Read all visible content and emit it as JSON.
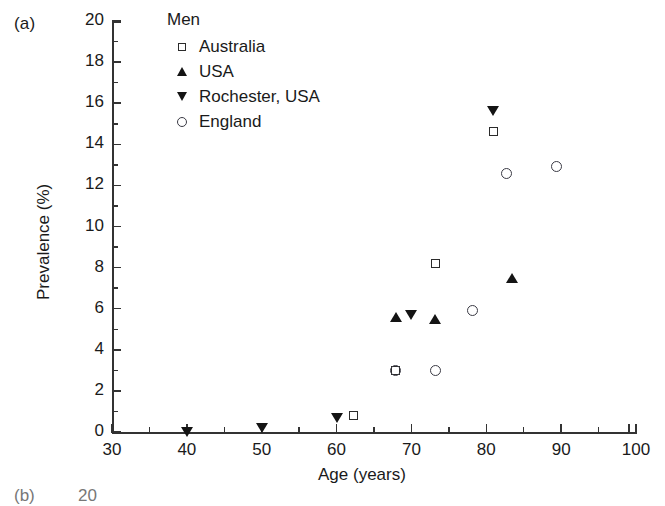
{
  "panel": {
    "label": "(a)"
  },
  "next_panel": {
    "label": "(b)",
    "first_tick": "20"
  },
  "legend": {
    "title": "Men",
    "items": [
      {
        "label": "Australia",
        "marker": "square-open-icon"
      },
      {
        "label": "USA",
        "marker": "triangle-up-filled-icon"
      },
      {
        "label": "Rochester, USA",
        "marker": "triangle-down-filled-icon"
      },
      {
        "label": "England",
        "marker": "circle-open-icon"
      }
    ]
  },
  "chart_data": {
    "type": "scatter",
    "title": "",
    "xlabel": "Age (years)",
    "ylabel": "Prevalence (%)",
    "xlim": [
      30,
      100
    ],
    "ylim": [
      0,
      20
    ],
    "xticks": [
      30,
      40,
      50,
      60,
      70,
      80,
      90,
      100
    ],
    "xtick_labels": [
      "30",
      "40",
      "50",
      "60",
      "70",
      "80",
      "90",
      "100"
    ],
    "x_minor_ticks": [
      35,
      45,
      55,
      65,
      75,
      85,
      95
    ],
    "yticks": [
      0,
      2,
      4,
      6,
      8,
      10,
      12,
      14,
      16,
      18,
      20
    ],
    "ytick_labels": [
      "0",
      "2",
      "4",
      "6",
      "8",
      "10",
      "12",
      "14",
      "16",
      "18",
      "20"
    ],
    "y_minor_ticks": [
      1,
      3,
      5,
      7,
      9,
      11,
      13,
      15,
      17,
      19
    ],
    "grid": false,
    "legend_position": "top-left-inside",
    "series": [
      {
        "name": "Australia",
        "marker": "square-open-icon",
        "points": [
          {
            "x": 62.2,
            "y": 0.8
          },
          {
            "x": 67.9,
            "y": 3.0
          },
          {
            "x": 73.2,
            "y": 8.2
          },
          {
            "x": 80.9,
            "y": 14.6
          }
        ]
      },
      {
        "name": "USA",
        "marker": "triangle-up-filled-icon",
        "points": [
          {
            "x": 67.9,
            "y": 5.6
          },
          {
            "x": 73.1,
            "y": 5.5
          },
          {
            "x": 83.4,
            "y": 7.5
          }
        ]
      },
      {
        "name": "Rochester, USA",
        "marker": "triangle-down-filled-icon",
        "points": [
          {
            "x": 40.0,
            "y": 0.0
          },
          {
            "x": 50.0,
            "y": 0.2
          },
          {
            "x": 60.0,
            "y": 0.65
          },
          {
            "x": 69.9,
            "y": 5.7
          },
          {
            "x": 80.9,
            "y": 15.6
          }
        ]
      },
      {
        "name": "England",
        "marker": "circle-open-icon",
        "points": [
          {
            "x": 67.9,
            "y": 3.0
          },
          {
            "x": 73.2,
            "y": 3.0
          },
          {
            "x": 78.2,
            "y": 5.9
          },
          {
            "x": 82.7,
            "y": 12.6
          },
          {
            "x": 89.4,
            "y": 12.9
          }
        ]
      }
    ]
  }
}
